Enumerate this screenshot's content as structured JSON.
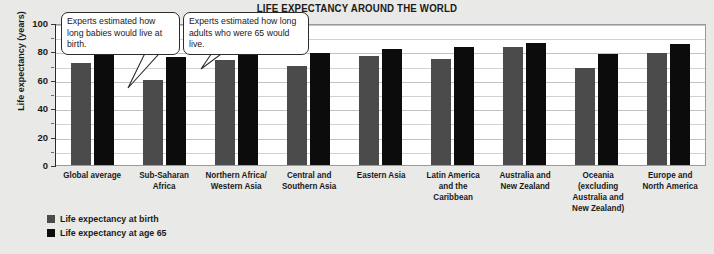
{
  "chart_data": {
    "type": "bar",
    "title": "LIFE EXPECTANCY AROUND THE WORLD",
    "xlabel": "",
    "ylabel": "Life expectancy (years)",
    "ylim": [
      0,
      100
    ],
    "ytick_labels": [
      "100",
      "80",
      "60",
      "40",
      "20",
      "0"
    ],
    "ytick_values": [
      100,
      80,
      60,
      40,
      20,
      0
    ],
    "minor_ticks": [
      90,
      70,
      50,
      30,
      10
    ],
    "grid": true,
    "legend_position": "below-left",
    "categories": [
      "Global average",
      "Sub-Saharan Africa",
      "Northern Africa/ Western Asia",
      "Central and Southern Asia",
      "Eastern Asia",
      "Latin America and the Caribbean",
      "Australia and New Zealand",
      "Oceania (excluding Australia and New Zealand)",
      "Europe and North America"
    ],
    "series": [
      {
        "name": "Life expectancy at birth",
        "color": "#4b4b4b",
        "values": [
          72,
          60,
          74,
          70,
          77,
          75,
          83,
          68,
          79
        ]
      },
      {
        "name": "Life expectancy at age 65",
        "color": "#0c0c0c",
        "values": [
          82,
          76,
          80,
          79,
          82,
          83,
          86,
          78,
          85
        ]
      }
    ],
    "annotations": [
      "Experts estimated how long babies would live at birth.",
      "Experts estimated how long adults who were 65 would live."
    ]
  },
  "chart": {
    "title": "LIFE EXPECTANCY AROUND THE WORLD",
    "y_axis_title": "Life expectancy (years)",
    "y_ticks": [
      "100",
      "80",
      "60",
      "40",
      "20",
      "0"
    ],
    "x_labels": [
      "Global average",
      "Sub-Saharan\nAfrica",
      "Northern Africa/\nWestern Asia",
      "Central and\nSouthern Asia",
      "Eastern Asia",
      "Latin America\nand the\nCaribbean",
      "Australia and\nNew Zealand",
      "Oceania\n(excluding\nAustralia and\nNew Zealand)",
      "Europe and\nNorth America"
    ],
    "legend": [
      {
        "label": "Life expectancy at birth",
        "color": "#4b4b4b"
      },
      {
        "label": "Life expectancy at age 65",
        "color": "#0c0c0c"
      }
    ],
    "callouts": [
      {
        "text": "Experts estimated how long babies would live at birth."
      },
      {
        "text": "Experts estimated how long adults who were 65 would live."
      }
    ]
  }
}
